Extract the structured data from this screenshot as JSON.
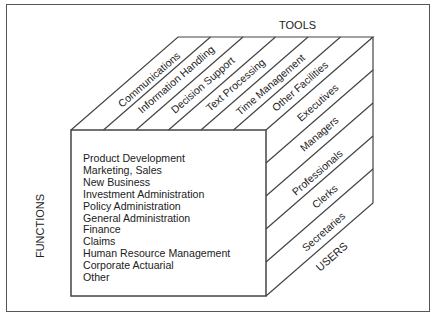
{
  "diagram": {
    "axes": {
      "top": "TOOLS",
      "left": "FUNCTIONS",
      "right": "USERS"
    },
    "tools": [
      "Communications",
      "Information Handling",
      "Decision Support",
      "Text Processing",
      "Time Management",
      "Other Facilities"
    ],
    "users": [
      "Executives",
      "Managers",
      "Professionals",
      "Clerks",
      "Secretaries"
    ],
    "functions": [
      "Product Development",
      "Marketing, Sales",
      "New Business",
      "Investment Administration",
      "Policy Administration",
      "General Administration",
      "Finance",
      "Claims",
      "Human Resource Management",
      "Corporate Actuarial",
      "Other"
    ],
    "colors": {
      "line": "#444444",
      "text": "#222222",
      "background": "#ffffff"
    }
  }
}
